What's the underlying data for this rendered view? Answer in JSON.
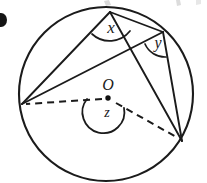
{
  "figure": {
    "bullet_marker": "●",
    "labels": {
      "center": "O",
      "angle_x": "x",
      "angle_y": "y",
      "angle_z": "z"
    },
    "colors": {
      "ink": "#1b1b1b",
      "paper": "#ffffff",
      "smudge": "#b9b9b9"
    },
    "geometry": {
      "circle": {
        "cx": 106,
        "cy": 94,
        "r": 87
      },
      "center_point": {
        "x": 108,
        "y": 98
      },
      "points": {
        "top_vertex": {
          "x": 110,
          "y": 12,
          "name": "P"
        },
        "right_vertex": {
          "x": 163,
          "y": 32,
          "name": "Q"
        },
        "left_vertex": {
          "x": 22,
          "y": 104,
          "name": "A"
        },
        "bottom_right_vertex": {
          "x": 182,
          "y": 141,
          "name": "B"
        }
      },
      "solid_chords": [
        {
          "from": "top_vertex",
          "to": "left_vertex"
        },
        {
          "from": "top_vertex",
          "to": "bottom_right_vertex"
        },
        {
          "from": "right_vertex",
          "to": "left_vertex"
        },
        {
          "from": "right_vertex",
          "to": "bottom_right_vertex"
        },
        {
          "from": "top_vertex",
          "to": "right_vertex"
        }
      ],
      "dashed_radii": [
        {
          "from": "center_point",
          "to": "left_vertex"
        },
        {
          "from": "center_point",
          "to": "bottom_right_vertex"
        }
      ],
      "angle_arcs": [
        {
          "label": "x",
          "at": "top_vertex"
        },
        {
          "label": "y",
          "at": "right_vertex"
        },
        {
          "label": "z",
          "at": "center_point",
          "reflex": true
        }
      ]
    }
  }
}
